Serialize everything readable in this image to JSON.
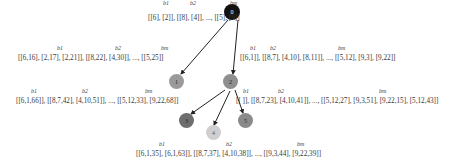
{
  "tree": {
    "nodes": [
      {
        "id": "0",
        "label": "0",
        "color": "#111111",
        "text_color": "#ffffff"
      },
      {
        "id": "1",
        "label": "1",
        "color": "#9a9a9a",
        "text_color": "#333333"
      },
      {
        "id": "2",
        "label": "2",
        "color": "#8f8f8f",
        "text_color": "#333333"
      },
      {
        "id": "3",
        "label": "3",
        "color": "#6e6e6e",
        "text_color": "#333333"
      },
      {
        "id": "4",
        "label": "4",
        "color": "#cfcfcf",
        "text_color": "#555555"
      },
      {
        "id": "5",
        "label": "5",
        "color": "#8a8a8a",
        "text_color": "#333333"
      }
    ],
    "edges": [
      [
        "0",
        "1"
      ],
      [
        "0",
        "2"
      ],
      [
        "2",
        "3"
      ],
      [
        "2",
        "4"
      ],
      [
        "2",
        "5"
      ]
    ]
  },
  "annotations": {
    "node0": {
      "headers": [
        "b1",
        "b2",
        "bm"
      ],
      "text": "[[6], [2]], [[8], [4]], ..., [[5], [9]]"
    },
    "node1": {
      "headers": [
        "b1",
        "b2",
        "bm"
      ],
      "text": "[[6,16], [2,17], [2,21]], [[8,22], [4,30]], ..., [[5,25]]"
    },
    "node2": {
      "headers": [
        "b1",
        "b2",
        "bm"
      ],
      "text": "[[6,1]], [[8,7], [4,10], [8,11]], ..., [[5,12], [9,3], [9,22]]"
    },
    "node3": {
      "headers": [
        "b1",
        "b2",
        "bm"
      ],
      "text": "[[6,1,66]], [[8,7,42], [4,10,51]], ..., [[5,12,33], [9,22,68]]"
    },
    "node5": {
      "headers": [
        "b1",
        "b2",
        "bm"
      ],
      "text": "[[ ]], [[8,7,23], [4,10,41]], ..., [[5,12,27], [9,3,51], [9,22,15], [5,12,43]]"
    },
    "node4": {
      "headers": [
        "b1",
        "b2",
        "bm"
      ],
      "text": "[[6,1,35], [6,1,63]], [[8,7,37], [4,10,38]], ..., [[9,3,44], [9,22,39]]"
    }
  }
}
